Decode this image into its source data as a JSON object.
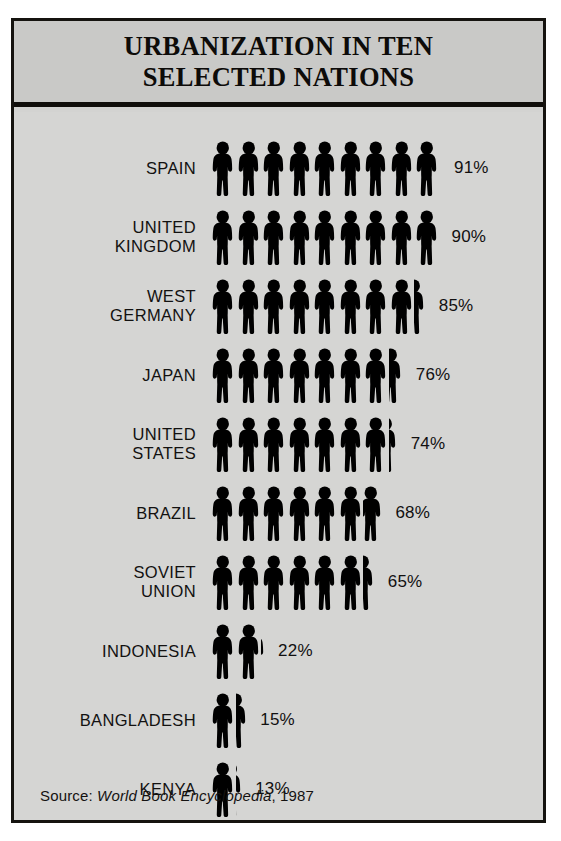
{
  "header": {
    "title": "URBANIZATION IN TEN\nSELECTED NATIONS"
  },
  "source": {
    "prefix": "Source:",
    "title": "World Book Encyclopedia",
    "suffix": ", 1987",
    "full_text": "Source: World Book Encyclopedia, 1987"
  },
  "symbol": {
    "name": "person-figure-icon",
    "unit_value": 10,
    "unit_label": "each figure = 10%",
    "color": "#000000"
  },
  "colors": {
    "background": "#d5d5d3",
    "header_background": "#c9c9c7",
    "border": "#15130f",
    "text": "#121110",
    "figure": "#000000"
  },
  "chart_data": {
    "type": "bar",
    "subtype": "pictogram",
    "title": "URBANIZATION IN TEN SELECTED NATIONS",
    "xlabel": "",
    "ylabel": "",
    "unit": "percent of population living in urban areas",
    "symbol_unit_value": 10,
    "xlim": [
      0,
      100
    ],
    "grid": false,
    "legend": false,
    "source": "World Book Encyclopedia, 1987",
    "categories": [
      "SPAIN",
      "UNITED KINGDOM",
      "WEST GERMANY",
      "JAPAN",
      "UNITED STATES",
      "BRAZIL",
      "SOVIET UNION",
      "INDONESIA",
      "BANGLADESH",
      "KENYA"
    ],
    "values": [
      91,
      90,
      85,
      76,
      74,
      68,
      65,
      22,
      15,
      13
    ],
    "value_labels": [
      "91%",
      "90%",
      "85%",
      "76%",
      "74%",
      "68%",
      "65%",
      "22%",
      "15%",
      "13%"
    ]
  },
  "rows": [
    {
      "label": "SPAIN",
      "value": 91,
      "value_label": "91%",
      "full_figures": 9,
      "partial_fraction": 0.1
    },
    {
      "label": "UNITED\nKINGDOM",
      "value": 90,
      "value_label": "90%",
      "full_figures": 9,
      "partial_fraction": 0
    },
    {
      "label": "WEST\nGERMANY",
      "value": 85,
      "value_label": "85%",
      "full_figures": 8,
      "partial_fraction": 0.5
    },
    {
      "label": "JAPAN",
      "value": 76,
      "value_label": "76%",
      "full_figures": 7,
      "partial_fraction": 0.6
    },
    {
      "label": "UNITED\nSTATES",
      "value": 74,
      "value_label": "74%",
      "full_figures": 7,
      "partial_fraction": 0.4
    },
    {
      "label": "BRAZIL",
      "value": 68,
      "value_label": "68%",
      "full_figures": 6,
      "partial_fraction": 0.8
    },
    {
      "label": "SOVIET\nUNION",
      "value": 65,
      "value_label": "65%",
      "full_figures": 6,
      "partial_fraction": 0.5
    },
    {
      "label": "INDONESIA",
      "value": 22,
      "value_label": "22%",
      "full_figures": 2,
      "partial_fraction": 0.2
    },
    {
      "label": "BANGLADESH",
      "value": 15,
      "value_label": "15%",
      "full_figures": 1,
      "partial_fraction": 0.5
    },
    {
      "label": "KENYA",
      "value": 13,
      "value_label": "13%",
      "full_figures": 1,
      "partial_fraction": 0.3
    }
  ]
}
